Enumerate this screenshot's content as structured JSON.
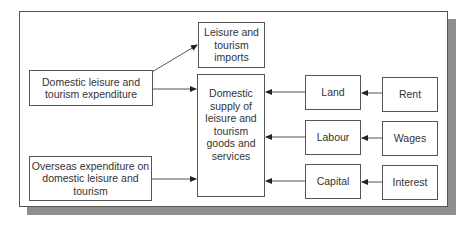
{
  "diagram": {
    "boxes": {
      "domestic_expenditure": "Domestic leisure and tourism expenditure",
      "overseas_expenditure": "Overseas expenditure on domestic leisure and tourism",
      "imports": "Leisure and tourism imports",
      "domestic_supply": "Domestic supply of leisure and tourism goods and services",
      "land": "Land",
      "labour": "Labour",
      "capital": "Capital",
      "rent": "Rent",
      "wages": "Wages",
      "interest": "Interest"
    },
    "edges": [
      {
        "from": "domestic_expenditure",
        "to": "imports"
      },
      {
        "from": "domestic_expenditure",
        "to": "domestic_supply"
      },
      {
        "from": "overseas_expenditure",
        "to": "domestic_supply"
      },
      {
        "from": "land",
        "to": "domestic_supply"
      },
      {
        "from": "labour",
        "to": "domestic_supply"
      },
      {
        "from": "capital",
        "to": "domestic_supply"
      },
      {
        "from": "rent",
        "to": "land"
      },
      {
        "from": "wages",
        "to": "labour"
      },
      {
        "from": "interest",
        "to": "capital"
      }
    ],
    "colors": {
      "line": "#555555",
      "shadow": "#8e8e8e",
      "text": "#333333"
    }
  }
}
